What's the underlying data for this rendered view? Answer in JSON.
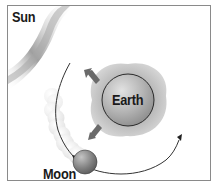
{
  "diagram": {
    "labels": {
      "sun": "Sun",
      "earth": "Earth",
      "moon": "Moon"
    },
    "elements": {
      "sun": {
        "description": "sun glow in top-left corner",
        "color": "#9a9a9a"
      },
      "earth": {
        "description": "Earth sphere with tidal bulge",
        "sphere_color": "#a8a8a8",
        "bulge_color": "#bdbdbd"
      },
      "moon": {
        "description": "Moon sphere with ghosted previous positions trail",
        "color": "#7d7d7d"
      },
      "orbit": {
        "description": "curved orbital path arrow of the Moon around Earth",
        "color": "#333333"
      },
      "bulge_arrows": {
        "description": "two arrows indicating tidal bulge direction",
        "count": 2,
        "color": "#666666"
      }
    }
  }
}
